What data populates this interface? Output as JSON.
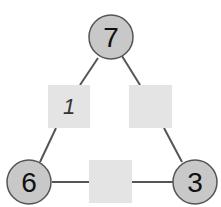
{
  "diagram": {
    "type": "number-triangle",
    "colors": {
      "circle_fill": "#c8c8c8",
      "circle_stroke": "#555555",
      "box_fill": "#e4e4e4",
      "line": "#555555"
    },
    "circles": [
      {
        "id": "top",
        "value": "7"
      },
      {
        "id": "bottom-left",
        "value": "6"
      },
      {
        "id": "bottom-right",
        "value": "3"
      }
    ],
    "boxes": [
      {
        "id": "left-edge",
        "value": "1"
      },
      {
        "id": "right-edge",
        "value": ""
      },
      {
        "id": "bottom-edge",
        "value": ""
      }
    ]
  }
}
